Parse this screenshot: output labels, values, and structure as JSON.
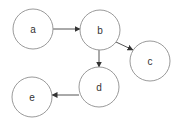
{
  "diagram": {
    "type": "directed-graph",
    "nodes": [
      {
        "id": "a",
        "label": "a",
        "cx": 33,
        "cy": 29,
        "r": 20
      },
      {
        "id": "b",
        "label": "b",
        "cx": 100,
        "cy": 30,
        "r": 20
      },
      {
        "id": "c",
        "label": "c",
        "cx": 150,
        "cy": 61,
        "r": 20
      },
      {
        "id": "d",
        "label": "d",
        "cx": 99,
        "cy": 87,
        "r": 20
      },
      {
        "id": "e",
        "label": "e",
        "cx": 32,
        "cy": 97,
        "r": 20
      }
    ],
    "edges": [
      {
        "from": "a",
        "to": "b"
      },
      {
        "from": "b",
        "to": "c"
      },
      {
        "from": "b",
        "to": "d"
      },
      {
        "from": "d",
        "to": "e"
      }
    ],
    "colors": {
      "node_stroke": "#9a9a9a",
      "edge": "#555555",
      "label": "#333333",
      "background": "#ffffff"
    }
  }
}
